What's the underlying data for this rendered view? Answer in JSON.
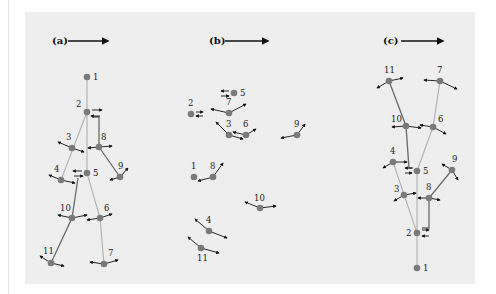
{
  "figure": {
    "background": "#eeeeee",
    "node_color": "#7a7a7a",
    "light_edge_color": "#b0b0b0",
    "dark_edge_color": "#6a6a6a",
    "arrow_color": "#111111"
  },
  "panels": [
    {
      "id": "a",
      "label": "(a)",
      "label_pos": [
        52,
        44
      ],
      "direction_arrow": {
        "x1": 68,
        "y1": 41,
        "x2": 108,
        "y2": 41
      },
      "nodes": [
        {
          "id": "1",
          "x": 87,
          "y": 77,
          "lx": 93,
          "ly": 80
        },
        {
          "id": "2",
          "x": 87,
          "y": 112,
          "lx": 76,
          "ly": 107
        },
        {
          "id": "3",
          "x": 72,
          "y": 148,
          "lx": 66,
          "ly": 140
        },
        {
          "id": "8",
          "x": 99,
          "y": 147,
          "lx": 101,
          "ly": 140
        },
        {
          "id": "4",
          "x": 61,
          "y": 180,
          "lx": 54,
          "ly": 172
        },
        {
          "id": "5",
          "x": 87,
          "y": 173,
          "lx": 93,
          "ly": 176
        },
        {
          "id": "9",
          "x": 120,
          "y": 177,
          "lx": 118,
          "ly": 169
        },
        {
          "id": "10",
          "x": 72,
          "y": 218,
          "lx": 60,
          "ly": 211
        },
        {
          "id": "6",
          "x": 100,
          "y": 218,
          "lx": 104,
          "ly": 211
        },
        {
          "id": "11",
          "x": 51,
          "y": 263,
          "lx": 43,
          "ly": 254
        },
        {
          "id": "7",
          "x": 104,
          "y": 264,
          "lx": 108,
          "ly": 256
        }
      ],
      "edges": [
        {
          "pts": [
            [
              87,
              77
            ],
            [
              87,
              173
            ]
          ],
          "style": "light"
        },
        {
          "pts": [
            [
              87,
              112
            ],
            [
              61,
              180
            ]
          ],
          "style": "light"
        },
        {
          "pts": [
            [
              92,
              117
            ],
            [
              99,
              117
            ],
            [
              99,
              147
            ]
          ],
          "style": "dark"
        },
        {
          "pts": [
            [
              99,
              147
            ],
            [
              120,
              177
            ]
          ],
          "style": "dark"
        },
        {
          "pts": [
            [
              87,
              173
            ],
            [
              100,
              218
            ],
            [
              104,
              264
            ]
          ],
          "style": "light"
        },
        {
          "pts": [
            [
              78,
              178
            ],
            [
              72,
              218
            ],
            [
              51,
              263
            ]
          ],
          "style": "dark"
        }
      ],
      "arrows": [
        [
          92,
          110,
          102,
          110
        ],
        [
          100,
          116,
          91,
          116
        ],
        [
          72,
          148,
          58,
          142
        ],
        [
          72,
          148,
          84,
          152
        ],
        [
          99,
          147,
          88,
          148
        ],
        [
          99,
          147,
          112,
          146
        ],
        [
          120,
          177,
          128,
          168
        ],
        [
          120,
          177,
          110,
          180
        ],
        [
          61,
          180,
          49,
          175
        ],
        [
          61,
          180,
          75,
          183
        ],
        [
          82,
          171,
          73,
          171
        ],
        [
          74,
          176,
          83,
          176
        ],
        [
          72,
          218,
          58,
          215
        ],
        [
          72,
          218,
          87,
          215
        ],
        [
          100,
          218,
          87,
          220
        ],
        [
          100,
          218,
          112,
          214
        ],
        [
          51,
          263,
          40,
          256
        ],
        [
          51,
          263,
          64,
          266
        ],
        [
          104,
          264,
          90,
          262
        ],
        [
          104,
          264,
          118,
          260
        ]
      ]
    },
    {
      "id": "b",
      "label": "(b)",
      "label_pos": [
        209,
        44
      ],
      "direction_arrow": {
        "x1": 225,
        "y1": 41,
        "x2": 268,
        "y2": 41
      },
      "nodes": [
        {
          "id": "5",
          "x": 234,
          "y": 93,
          "lx": 240,
          "ly": 96
        },
        {
          "id": "2",
          "x": 191,
          "y": 114,
          "lx": 188,
          "ly": 106
        },
        {
          "id": "7",
          "x": 229,
          "y": 113,
          "lx": 226,
          "ly": 105
        },
        {
          "id": "3",
          "x": 229,
          "y": 135,
          "lx": 226,
          "ly": 127
        },
        {
          "id": "6",
          "x": 246,
          "y": 135,
          "lx": 243,
          "ly": 127
        },
        {
          "id": "9",
          "x": 297,
          "y": 135,
          "lx": 294,
          "ly": 127
        },
        {
          "id": "1",
          "x": 194,
          "y": 177,
          "lx": 191,
          "ly": 169
        },
        {
          "id": "8",
          "x": 213,
          "y": 177,
          "lx": 210,
          "ly": 169
        },
        {
          "id": "10",
          "x": 260,
          "y": 208,
          "lx": 254,
          "ly": 201
        },
        {
          "id": "4",
          "x": 209,
          "y": 231,
          "lx": 206,
          "ly": 223
        },
        {
          "id": "11",
          "x": 201,
          "y": 248,
          "lx": 197,
          "ly": 261
        }
      ],
      "edges": [],
      "arrows": [
        [
          229,
          91,
          221,
          91
        ],
        [
          221,
          96,
          229,
          96
        ],
        [
          196,
          112,
          203,
          112
        ],
        [
          203,
          116,
          196,
          116
        ],
        [
          229,
          113,
          211,
          109
        ],
        [
          229,
          113,
          246,
          104
        ],
        [
          229,
          135,
          216,
          122
        ],
        [
          229,
          135,
          243,
          139
        ],
        [
          246,
          135,
          233,
          132
        ],
        [
          246,
          135,
          256,
          129
        ],
        [
          297,
          135,
          305,
          124
        ],
        [
          297,
          135,
          281,
          138
        ],
        [
          213,
          177,
          223,
          163
        ],
        [
          213,
          177,
          198,
          181
        ],
        [
          260,
          208,
          245,
          202
        ],
        [
          260,
          208,
          276,
          206
        ],
        [
          209,
          231,
          195,
          219
        ],
        [
          209,
          231,
          227,
          238
        ],
        [
          201,
          248,
          188,
          237
        ],
        [
          201,
          248,
          219,
          253
        ]
      ]
    },
    {
      "id": "c",
      "label": "(c)",
      "label_pos": [
        383,
        44
      ],
      "direction_arrow": {
        "x1": 401,
        "y1": 41,
        "x2": 443,
        "y2": 41
      },
      "nodes": [
        {
          "id": "11",
          "x": 389,
          "y": 81,
          "lx": 384,
          "ly": 73
        },
        {
          "id": "7",
          "x": 440,
          "y": 81,
          "lx": 437,
          "ly": 73
        },
        {
          "id": "10",
          "x": 406,
          "y": 126,
          "lx": 391,
          "ly": 122
        },
        {
          "id": "6",
          "x": 433,
          "y": 127,
          "lx": 438,
          "ly": 122
        },
        {
          "id": "4",
          "x": 393,
          "y": 162,
          "lx": 390,
          "ly": 154
        },
        {
          "id": "5",
          "x": 417,
          "y": 171,
          "lx": 423,
          "ly": 174
        },
        {
          "id": "9",
          "x": 452,
          "y": 170,
          "lx": 452,
          "ly": 162
        },
        {
          "id": "3",
          "x": 404,
          "y": 195,
          "lx": 394,
          "ly": 192
        },
        {
          "id": "8",
          "x": 429,
          "y": 198,
          "lx": 426,
          "ly": 190
        },
        {
          "id": "2",
          "x": 417,
          "y": 233,
          "lx": 406,
          "ly": 236
        },
        {
          "id": "1",
          "x": 417,
          "y": 268,
          "lx": 423,
          "ly": 271
        }
      ],
      "edges": [
        {
          "pts": [
            [
              417,
              268
            ],
            [
              417,
              171
            ]
          ],
          "style": "light"
        },
        {
          "pts": [
            [
              417,
              233
            ],
            [
              393,
              162
            ]
          ],
          "style": "light"
        },
        {
          "pts": [
            [
              417,
              171
            ],
            [
              433,
              127
            ],
            [
              440,
              81
            ]
          ],
          "style": "light"
        },
        {
          "pts": [
            [
              389,
              81
            ],
            [
              406,
              126
            ],
            [
              409,
              168
            ],
            [
              413,
              168
            ]
          ],
          "style": "dark"
        },
        {
          "pts": [
            [
              452,
              170
            ],
            [
              429,
              198
            ],
            [
              429,
              228
            ],
            [
              422,
              228
            ]
          ],
          "style": "dark"
        }
      ],
      "arrows": [
        [
          389,
          81,
          377,
          88
        ],
        [
          389,
          81,
          403,
          78
        ],
        [
          440,
          81,
          424,
          80
        ],
        [
          440,
          81,
          457,
          89
        ],
        [
          406,
          126,
          392,
          127
        ],
        [
          406,
          126,
          421,
          128
        ],
        [
          433,
          127,
          420,
          125
        ],
        [
          433,
          127,
          446,
          134
        ],
        [
          393,
          162,
          383,
          168
        ],
        [
          393,
          162,
          407,
          162
        ],
        [
          412,
          168,
          405,
          168
        ],
        [
          405,
          173,
          412,
          173
        ],
        [
          452,
          170,
          442,
          164
        ],
        [
          452,
          170,
          458,
          180
        ],
        [
          404,
          195,
          394,
          201
        ],
        [
          404,
          195,
          416,
          193
        ],
        [
          429,
          198,
          418,
          198
        ],
        [
          429,
          198,
          440,
          200
        ],
        [
          422,
          230,
          429,
          230
        ],
        [
          429,
          236,
          422,
          236
        ]
      ]
    }
  ]
}
